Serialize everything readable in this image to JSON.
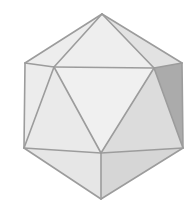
{
  "figure": {
    "width": 190,
    "height": 207,
    "edge_color": "#9c9c9c",
    "edge_width": 1.6,
    "vertices": {
      "top": [
        102,
        14
      ],
      "upper_left": [
        25,
        63
      ],
      "inner_left": [
        54,
        67
      ],
      "inner_right": [
        154,
        68
      ],
      "upper_right": [
        182,
        63
      ],
      "lower_left": [
        24,
        148
      ],
      "center_bottom": [
        101,
        153
      ],
      "lower_right": [
        183,
        148
      ],
      "bottom": [
        101,
        199
      ]
    },
    "faces": [
      {
        "name": "top-left-face",
        "pts": [
          "top",
          "upper_left",
          "inner_left"
        ],
        "fill": "#ededed"
      },
      {
        "name": "top-center-face",
        "pts": [
          "top",
          "inner_left",
          "inner_right"
        ],
        "fill": "#eeeeee"
      },
      {
        "name": "top-right-face",
        "pts": [
          "top",
          "inner_right",
          "upper_right"
        ],
        "fill": "#e2e2e2"
      },
      {
        "name": "left-upper-face",
        "pts": [
          "upper_left",
          "inner_left",
          "lower_left"
        ],
        "fill": "#ececec"
      },
      {
        "name": "left-center-face",
        "pts": [
          "inner_left",
          "lower_left",
          "center_bottom"
        ],
        "fill": "#eaeaea"
      },
      {
        "name": "center-face",
        "pts": [
          "inner_left",
          "inner_right",
          "center_bottom"
        ],
        "fill": "#f0f0f0"
      },
      {
        "name": "right-center-face",
        "pts": [
          "inner_right",
          "center_bottom",
          "lower_right"
        ],
        "fill": "#dcdcdc"
      },
      {
        "name": "right-dark-face",
        "pts": [
          "inner_right",
          "upper_right",
          "lower_right"
        ],
        "fill": "#ababab"
      },
      {
        "name": "bottom-left-face",
        "pts": [
          "lower_left",
          "center_bottom",
          "bottom"
        ],
        "fill": "#e6e6e6"
      },
      {
        "name": "bottom-right-face",
        "pts": [
          "center_bottom",
          "lower_right",
          "bottom"
        ],
        "fill": "#d6d6d6"
      }
    ],
    "edges": [
      [
        "top",
        "upper_left"
      ],
      [
        "top",
        "inner_left"
      ],
      [
        "top",
        "inner_right"
      ],
      [
        "top",
        "upper_right"
      ],
      [
        "upper_left",
        "inner_left"
      ],
      [
        "inner_left",
        "inner_right"
      ],
      [
        "inner_right",
        "upper_right"
      ],
      [
        "upper_left",
        "lower_left"
      ],
      [
        "inner_left",
        "lower_left"
      ],
      [
        "inner_left",
        "center_bottom"
      ],
      [
        "inner_right",
        "center_bottom"
      ],
      [
        "inner_right",
        "lower_right"
      ],
      [
        "upper_right",
        "lower_right"
      ],
      [
        "lower_left",
        "center_bottom"
      ],
      [
        "center_bottom",
        "lower_right"
      ],
      [
        "lower_left",
        "bottom"
      ],
      [
        "center_bottom",
        "bottom"
      ],
      [
        "lower_right",
        "bottom"
      ]
    ]
  }
}
